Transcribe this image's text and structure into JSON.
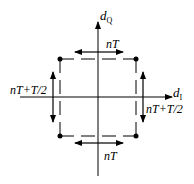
{
  "diagram": {
    "axes": {
      "vertical_label": "d",
      "vertical_subscript": "Q",
      "horizontal_label": "d",
      "horizontal_subscript": "I"
    },
    "labels": {
      "top": "nT",
      "bottom": "nT",
      "left": "nT+T/2",
      "right": "nT+T/2"
    },
    "colors": {
      "stroke": "#000000",
      "background": "#ffffff"
    }
  }
}
